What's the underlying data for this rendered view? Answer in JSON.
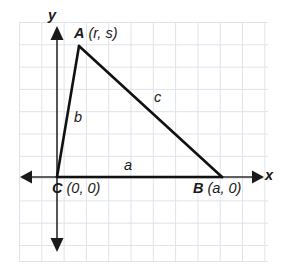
{
  "figure": {
    "type": "geometry-diagram",
    "axes": {
      "x_label": "x",
      "y_label": "y",
      "x_axis_y_pixel": 177,
      "y_axis_x_pixel": 57,
      "arrowheads": [
        "left",
        "right",
        "up",
        "down"
      ]
    },
    "grid": {
      "visible": true,
      "spacing_px": 22.3,
      "color": "#dfe3ea",
      "left": 19,
      "top": 22,
      "right": 268,
      "bottom": 262
    },
    "stroke_color": "#1a1a1a",
    "vertices": [
      {
        "name": "A",
        "label_point": "A",
        "label_coord": "(r, s)",
        "x": 79,
        "y": 46
      },
      {
        "name": "C",
        "label_point": "C",
        "label_coord": "(0, 0)",
        "x": 57,
        "y": 177
      },
      {
        "name": "B",
        "label_point": "B",
        "label_coord": "(a, 0)",
        "x": 222,
        "y": 177
      }
    ],
    "sides": [
      {
        "name": "a",
        "label": "a",
        "from": "C",
        "to": "B"
      },
      {
        "name": "b",
        "label": "b",
        "from": "C",
        "to": "A"
      },
      {
        "name": "c",
        "label": "c",
        "from": "A",
        "to": "B"
      }
    ]
  },
  "labels": {
    "A_point": "A",
    "A_coord": "(r, s)",
    "C_point": "C",
    "C_coord": "(0, 0)",
    "B_point": "B",
    "B_coord": "(a, 0)",
    "side_a": "a",
    "side_b": "b",
    "side_c": "c",
    "axis_x": "x",
    "axis_y": "y"
  }
}
